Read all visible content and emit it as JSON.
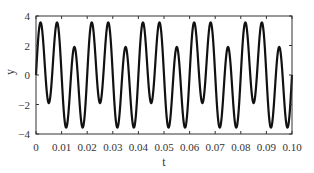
{
  "chart_data": {
    "type": "line",
    "title": "",
    "xlabel": "t",
    "ylabel": "y",
    "xlim": [
      0,
      0.1
    ],
    "ylim": [
      -4,
      4
    ],
    "x_ticks": [
      "0",
      "0.01",
      "0.02",
      "0.03",
      "0.04",
      "0.05",
      "0.06",
      "0.07",
      "0.08",
      "0.09",
      "0.10"
    ],
    "y_ticks": [
      "4",
      "2",
      "0",
      "-2",
      "-4"
    ],
    "grid": false,
    "legend": null,
    "series": [
      {
        "name": "y(t)",
        "color": "#111111",
        "description": "Sum of two sinusoids: ~1.1·sin(2π·50t) + 3·sin(2π·150t)",
        "components": [
          {
            "amplitude": 1.1,
            "frequency_hz": 50
          },
          {
            "amplitude": 3.0,
            "frequency_hz": 150
          }
        ],
        "peak_pattern": [
          3.6,
          3.6,
          2.0
        ],
        "trough_pattern": [
          -2.0,
          -3.4,
          -3.4
        ],
        "pattern_period_s": 0.02
      }
    ]
  }
}
